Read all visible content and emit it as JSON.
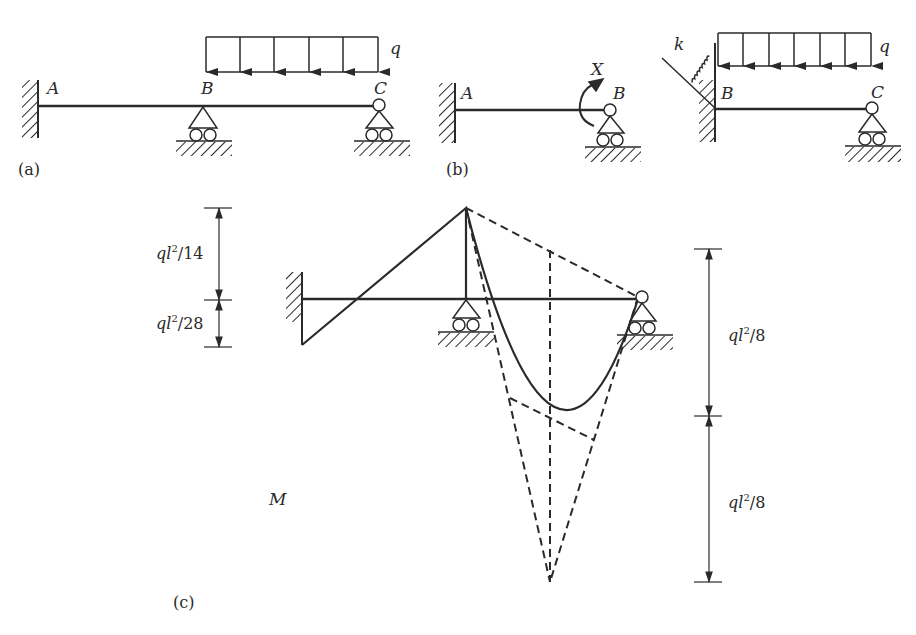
{
  "figure": {
    "panels": [
      {
        "id": "a",
        "tag": "(a)",
        "labels": {
          "A": "A",
          "B": "B",
          "C": "C",
          "load": "q"
        }
      },
      {
        "id": "b",
        "tag": "(b)",
        "labels": {
          "A": "A",
          "B": "B",
          "moment": "X"
        }
      },
      {
        "id": "b2",
        "labels": {
          "spring": "k",
          "B": "B",
          "C": "C",
          "load": "q"
        }
      },
      {
        "id": "c",
        "tag": "(c)",
        "labels": {
          "diagram": "M"
        }
      }
    ],
    "dimensions": {
      "left_top": {
        "q": "q",
        "l": "l",
        "exp": "2",
        "den": "/14"
      },
      "left_bottom": {
        "q": "q",
        "l": "l",
        "exp": "2",
        "den": "/28"
      },
      "right_top": {
        "q": "q",
        "l": "l",
        "exp": "2",
        "den": "/8"
      },
      "right_bottom": {
        "q": "q",
        "l": "l",
        "exp": "2",
        "den": "/8"
      }
    },
    "stroke_color": "#2a2a2a"
  }
}
